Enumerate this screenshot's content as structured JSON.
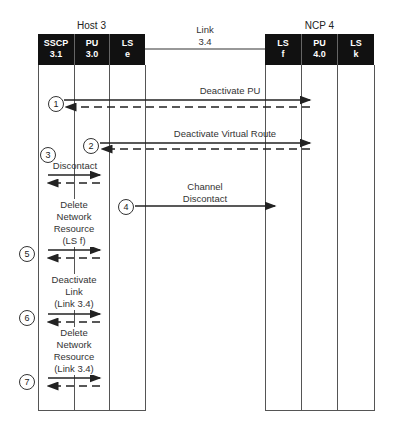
{
  "nodes": {
    "host": {
      "title": "Host 3",
      "columns": [
        {
          "name": "SSCP",
          "id": "3.1"
        },
        {
          "name": "PU",
          "id": "3.0"
        },
        {
          "name": "LS",
          "id": "e"
        }
      ]
    },
    "ncp": {
      "title": "NCP 4",
      "columns": [
        {
          "name": "LS",
          "id": "f"
        },
        {
          "name": "PU",
          "id": "4.0"
        },
        {
          "name": "LS",
          "id": "k"
        }
      ]
    }
  },
  "link": {
    "line1": "Link",
    "line2": "3.4"
  },
  "steps": [
    {
      "num": "1",
      "label": "Deactivate PU"
    },
    {
      "num": "2",
      "label": "Deactivate Virtual Route"
    },
    {
      "num": "3",
      "label": "Discontact"
    },
    {
      "num": "4",
      "label_line1": "Channel",
      "label_line2": "Discontact"
    },
    {
      "num": "5",
      "label_line1": "Delete",
      "label_line2": "Network",
      "label_line3": "Resource",
      "label_line4": "(LS f)"
    },
    {
      "num": "6",
      "label_line1": "Deactivate",
      "label_line2": "Link",
      "label_line3": "(Link 3.4)"
    },
    {
      "num": "7",
      "label_line1": "Delete",
      "label_line2": "Network",
      "label_line3": "Resource",
      "label_line4": "(Link 3.4)"
    }
  ]
}
